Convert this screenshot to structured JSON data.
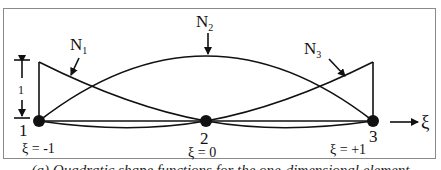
{
  "diagram": {
    "shape_functions": [
      {
        "name": "N",
        "subscript": "1",
        "formula": "ξ(ξ-1)/2"
      },
      {
        "name": "N",
        "subscript": "2",
        "formula": "1-ξ²"
      },
      {
        "name": "N",
        "subscript": "3",
        "formula": "ξ(ξ+1)/2"
      }
    ],
    "nodes": [
      {
        "id": "1",
        "xi_label": "ξ = -1"
      },
      {
        "id": "2",
        "xi_label": "ξ = 0"
      },
      {
        "id": "3",
        "xi_label": "ξ = +1"
      }
    ],
    "unit_height_label": "1",
    "axis_label": "ξ",
    "caption": "(a) Quadratic shape functions for the one-dimensional element"
  }
}
